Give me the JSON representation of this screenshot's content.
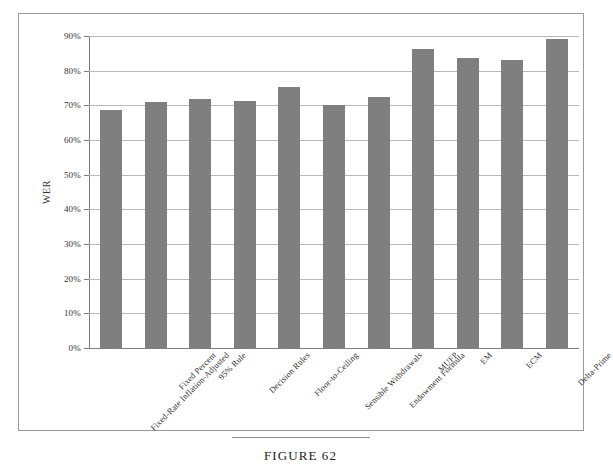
{
  "figure": {
    "caption": "FIGURE 62"
  },
  "chart_data": {
    "type": "bar",
    "title": "",
    "xlabel": "",
    "ylabel": "WER",
    "ylim": [
      0,
      90
    ],
    "ytick_labels": [
      "0%",
      "10%",
      "20%",
      "30%",
      "40%",
      "50%",
      "60%",
      "70%",
      "80%",
      "90%"
    ],
    "ytick_values": [
      0,
      10,
      20,
      30,
      40,
      50,
      60,
      70,
      80,
      90
    ],
    "grid": true,
    "legend": "none",
    "bar_color": "#7f7f7f",
    "categories": [
      "Fixed-Rate Inflation-Adjusted",
      "Fixed Percent",
      "95% Rule",
      "Decision Rules",
      "Floor-to-Ceiling",
      "Sensible Withdrawals",
      "Endowment Formula",
      "MUFP",
      "EM",
      "ECM",
      "Delta-Prime"
    ],
    "values": [
      68.8,
      71.0,
      71.7,
      71.2,
      75.3,
      70.2,
      72.5,
      86.2,
      83.6,
      83.0,
      89.1
    ]
  }
}
